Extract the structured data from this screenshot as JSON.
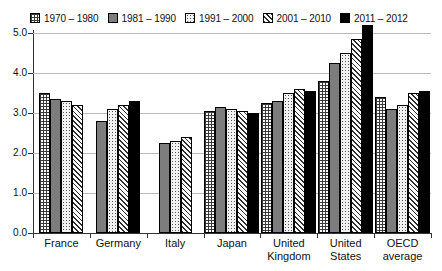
{
  "chart_data": {
    "type": "bar",
    "title": "",
    "subtitle": "",
    "xlabel": "",
    "ylabel": "",
    "ylim": [
      0.0,
      5.0
    ],
    "ytick_labels": [
      "0.0",
      "1.0",
      "2.0",
      "3.0",
      "4.0",
      "5.0"
    ],
    "ytick_values": [
      0.0,
      1.0,
      2.0,
      3.0,
      4.0,
      5.0
    ],
    "grid": true,
    "legend_position": "top",
    "categories": [
      "France",
      "Germany",
      "Italy",
      "Japan",
      "United Kingdom",
      "United States",
      "OECD average"
    ],
    "category_lines": [
      [
        "France"
      ],
      [
        "Germany"
      ],
      [
        "Italy"
      ],
      [
        "Japan"
      ],
      [
        "United",
        "Kingdom"
      ],
      [
        "United",
        "States"
      ],
      [
        "OECD",
        "average"
      ]
    ],
    "series": [
      {
        "name": "1970 – 1980",
        "pattern": "grid",
        "color": "#ffffff",
        "values": [
          3.5,
          null,
          null,
          3.05,
          3.25,
          3.8,
          3.4
        ]
      },
      {
        "name": "1981 – 1990",
        "pattern": "solid-gray",
        "color": "#7d7d7d",
        "values": [
          3.35,
          2.8,
          2.25,
          3.15,
          3.3,
          4.25,
          3.1
        ]
      },
      {
        "name": "1991 – 2000",
        "pattern": "dots",
        "color": "#f2f2f2",
        "values": [
          3.3,
          3.1,
          2.3,
          3.1,
          3.5,
          4.5,
          3.2
        ]
      },
      {
        "name": "2001 – 2010",
        "pattern": "diagonal",
        "color": "#ffffff",
        "values": [
          3.2,
          3.2,
          2.4,
          3.05,
          3.6,
          4.85,
          3.5
        ]
      },
      {
        "name": "2011 – 2012",
        "pattern": "black",
        "color": "#000000",
        "values": [
          null,
          3.3,
          null,
          3.0,
          3.55,
          5.2,
          3.55
        ]
      }
    ]
  }
}
